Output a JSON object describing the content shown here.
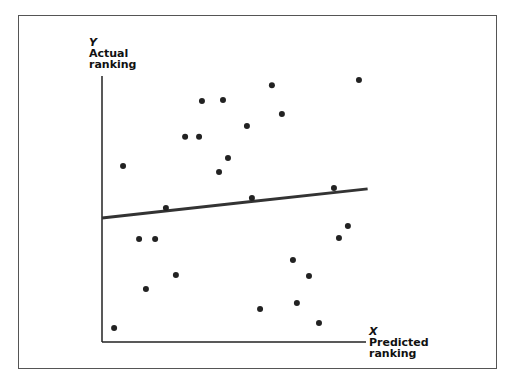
{
  "chart_data": {
    "type": "scatter",
    "title": "",
    "xlabel": "Predicted ranking",
    "ylabel": "Actual ranking",
    "x_var": "X",
    "y_var": "Y",
    "xlim": [
      0,
      100
    ],
    "ylim": [
      0,
      100
    ],
    "grid": false,
    "legend": null,
    "ticks": "none",
    "points": [
      {
        "x": 38.0,
        "y": 91.3
      },
      {
        "x": 46.0,
        "y": 91.7
      },
      {
        "x": 31.6,
        "y": 77.7
      },
      {
        "x": 36.9,
        "y": 77.7
      },
      {
        "x": 8.0,
        "y": 66.7
      },
      {
        "x": 47.9,
        "y": 69.7
      },
      {
        "x": 44.5,
        "y": 64.4
      },
      {
        "x": 64.6,
        "y": 97.3
      },
      {
        "x": 97.7,
        "y": 99.2
      },
      {
        "x": 68.4,
        "y": 86.4
      },
      {
        "x": 55.1,
        "y": 81.8
      },
      {
        "x": 88.2,
        "y": 58.3
      },
      {
        "x": 57.0,
        "y": 54.5
      },
      {
        "x": 24.3,
        "y": 50.8
      },
      {
        "x": 14.1,
        "y": 39.0
      },
      {
        "x": 20.2,
        "y": 39.0
      },
      {
        "x": 28.1,
        "y": 25.4
      },
      {
        "x": 16.7,
        "y": 20.1
      },
      {
        "x": 4.6,
        "y": 5.3
      },
      {
        "x": 93.5,
        "y": 43.9
      },
      {
        "x": 90.1,
        "y": 39.4
      },
      {
        "x": 72.6,
        "y": 31.1
      },
      {
        "x": 78.7,
        "y": 25.0
      },
      {
        "x": 74.1,
        "y": 14.8
      },
      {
        "x": 60.1,
        "y": 12.5
      },
      {
        "x": 82.5,
        "y": 7.2
      }
    ],
    "trend_line": {
      "x": [
        0,
        101
      ],
      "y": [
        47.0,
        58.0
      ]
    },
    "annotations": []
  },
  "colors": {
    "point": "#222222",
    "line": "#333333",
    "axis": "#222222",
    "frame": "#555555"
  },
  "labels": {
    "y_var": "Y",
    "y_line1": "Actual",
    "y_line2": "ranking",
    "x_var": "X",
    "x_line1": "Predicted",
    "x_line2": "ranking"
  }
}
